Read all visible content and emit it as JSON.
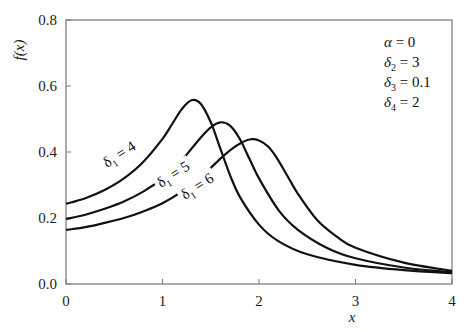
{
  "chart_data": {
    "type": "line",
    "title": "",
    "xlabel": "x",
    "ylabel": "f(x)",
    "xlim": [
      0,
      4
    ],
    "ylim": [
      0.0,
      0.8
    ],
    "xticks": [
      "0",
      "1",
      "2",
      "3",
      "4"
    ],
    "yticks": [
      "0.0",
      "0.2",
      "0.4",
      "0.6",
      "0.8"
    ],
    "grid": false,
    "legend": "inline curve labels",
    "parameters": [
      "α = 0",
      "δ2 = 3",
      "δ3 = 0.1",
      "δ4 = 2"
    ],
    "series": [
      {
        "name": "δ1 = 4",
        "x": [
          0,
          0.2,
          0.4,
          0.6,
          0.8,
          1.0,
          1.1,
          1.2,
          1.3,
          1.4,
          1.5,
          1.6,
          1.7,
          1.8,
          2.0,
          2.2,
          2.5,
          3.0,
          3.5,
          4.0
        ],
        "y": [
          0.243,
          0.26,
          0.285,
          0.32,
          0.37,
          0.44,
          0.485,
          0.53,
          0.557,
          0.545,
          0.49,
          0.41,
          0.33,
          0.265,
          0.18,
          0.13,
          0.09,
          0.058,
          0.042,
          0.033
        ]
      },
      {
        "name": "δ1 = 5",
        "x": [
          0,
          0.2,
          0.4,
          0.6,
          0.8,
          1.0,
          1.2,
          1.3,
          1.4,
          1.5,
          1.6,
          1.7,
          1.8,
          1.9,
          2.0,
          2.2,
          2.4,
          2.7,
          3.0,
          3.5,
          4.0
        ],
        "y": [
          0.197,
          0.21,
          0.228,
          0.25,
          0.28,
          0.32,
          0.375,
          0.41,
          0.445,
          0.475,
          0.49,
          0.48,
          0.44,
          0.38,
          0.32,
          0.225,
          0.165,
          0.11,
          0.078,
          0.05,
          0.036
        ]
      },
      {
        "name": "δ1 = 6",
        "x": [
          0,
          0.2,
          0.4,
          0.6,
          0.8,
          1.0,
          1.2,
          1.4,
          1.6,
          1.7,
          1.8,
          1.9,
          2.0,
          2.1,
          2.2,
          2.3,
          2.4,
          2.6,
          2.8,
          3.0,
          3.5,
          4.0
        ],
        "y": [
          0.164,
          0.172,
          0.185,
          0.2,
          0.22,
          0.245,
          0.28,
          0.325,
          0.38,
          0.405,
          0.425,
          0.438,
          0.435,
          0.415,
          0.375,
          0.325,
          0.275,
          0.195,
          0.145,
          0.11,
          0.065,
          0.04
        ]
      }
    ]
  },
  "labels": {
    "y_axis": "f(x)",
    "x_axis": "x",
    "params": {
      "alpha": {
        "sym": "α",
        "sub": "",
        "val": " = 0"
      },
      "d2": {
        "sym": "δ",
        "sub": "2",
        "val": " = 3"
      },
      "d3": {
        "sym": "δ",
        "sub": "3",
        "val": " = 0.1"
      },
      "d4": {
        "sym": "δ",
        "sub": "2",
        "val": " = 2"
      }
    },
    "curves": [
      {
        "sym": "δ",
        "sub": "1",
        "val": " = 4"
      },
      {
        "sym": "δ",
        "sub": "1",
        "val": " = 5"
      },
      {
        "sym": "δ",
        "sub": "1",
        "val": " = 6"
      }
    ]
  }
}
